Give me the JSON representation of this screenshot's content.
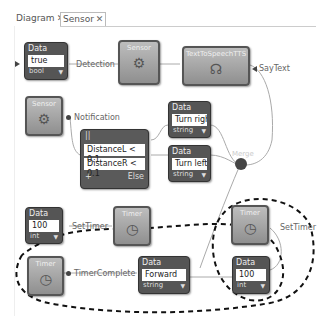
{
  "tabs": [
    {
      "label": "Diagram",
      "close": "✕",
      "active": false
    },
    {
      "label": "Sensor",
      "close": "✕",
      "active": true
    }
  ],
  "nodes": {
    "data_true": {
      "header": "Data",
      "value": "true",
      "type": "bool"
    },
    "sensor1": {
      "title": "Sensor",
      "icon": "gear-icon"
    },
    "tts": {
      "title": "TextToSpeechTTS",
      "icon": "speaker-icon"
    },
    "sensor2": {
      "title": "Sensor",
      "icon": "gear-icon"
    },
    "switch": {
      "header": "||",
      "cases": [
        "DistanceL < 0.1",
        "DistanceR < 0.1"
      ],
      "add": "+",
      "else": "Else"
    },
    "data_right": {
      "header": "Data",
      "value": "Turn right",
      "type": "string"
    },
    "data_left": {
      "header": "Data",
      "value": "Turn left",
      "type": "string"
    },
    "data_100a": {
      "header": "Data",
      "value": "100",
      "type": "int"
    },
    "timer1": {
      "title": "Timer",
      "icon": "stopwatch-icon"
    },
    "timer2": {
      "title": "Timer",
      "icon": "stopwatch-icon"
    },
    "timer3": {
      "title": "Timer",
      "icon": "stopwatch-icon"
    },
    "data_forward": {
      "header": "Data",
      "value": "Forward",
      "type": "string"
    },
    "data_100b": {
      "header": "Data",
      "value": "100",
      "type": "int"
    }
  },
  "labels": {
    "detection": "Detection",
    "saytext": "SayText",
    "notification": "Notification",
    "merge": "Merge",
    "settimer1": "SetTimer",
    "settimer2": "SetTimer",
    "timercomplete": "TimerComplete"
  }
}
